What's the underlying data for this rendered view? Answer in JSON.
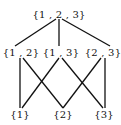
{
  "diagram": {
    "type": "hasse-diagram",
    "nodes": [
      {
        "id": "n123",
        "label": "{1 , 2 , 3}",
        "x": 59,
        "y": 14
      },
      {
        "id": "n12",
        "label": "{1 , 2}",
        "x": 21,
        "y": 52
      },
      {
        "id": "n13",
        "label": "{1 , 3}",
        "x": 61,
        "y": 52
      },
      {
        "id": "n23",
        "label": "{2 , 3}",
        "x": 103,
        "y": 52
      },
      {
        "id": "n1",
        "label": "{1}",
        "x": 20,
        "y": 114
      },
      {
        "id": "n2",
        "label": "{2}",
        "x": 63,
        "y": 114
      },
      {
        "id": "n3",
        "label": "{3}",
        "x": 104,
        "y": 114
      }
    ],
    "edges": [
      {
        "from": "n123",
        "to": "n12",
        "x1": 56,
        "y1": 19,
        "x2": 15,
        "y2": 46
      },
      {
        "from": "n123",
        "to": "n13",
        "x1": 59,
        "y1": 19,
        "x2": 59,
        "y2": 46
      },
      {
        "from": "n123",
        "to": "n23",
        "x1": 62,
        "y1": 19,
        "x2": 110,
        "y2": 46
      },
      {
        "from": "n12",
        "to": "n1",
        "x1": 20,
        "y1": 58,
        "x2": 20,
        "y2": 108
      },
      {
        "from": "n12",
        "to": "n2",
        "x1": 23,
        "y1": 58,
        "x2": 63,
        "y2": 108
      },
      {
        "from": "n13",
        "to": "n1",
        "x1": 59,
        "y1": 58,
        "x2": 22,
        "y2": 108
      },
      {
        "from": "n13",
        "to": "n3",
        "x1": 62,
        "y1": 58,
        "x2": 103,
        "y2": 108
      },
      {
        "from": "n23",
        "to": "n2",
        "x1": 101,
        "y1": 58,
        "x2": 63,
        "y2": 108
      },
      {
        "from": "n23",
        "to": "n3",
        "x1": 105,
        "y1": 58,
        "x2": 105,
        "y2": 108
      }
    ]
  }
}
